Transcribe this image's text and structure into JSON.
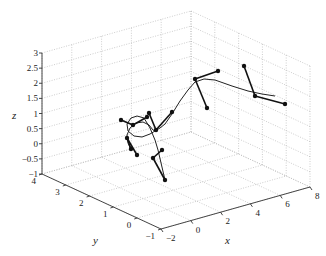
{
  "chart_data": {
    "type": "line3d",
    "title": "",
    "xlabel": "x",
    "ylabel": "y",
    "zlabel": "z",
    "xlim": [
      -2,
      8
    ],
    "ylim": [
      -1,
      4
    ],
    "zlim": [
      -1,
      3
    ],
    "xticks": [
      "-2",
      "0",
      "2",
      "4",
      "6",
      "8"
    ],
    "yticks": [
      "-1",
      "0",
      "1",
      "2",
      "3",
      "4"
    ],
    "zticks": [
      "-1",
      "-0.5",
      "0",
      "0.5",
      "1",
      "1.5",
      "2",
      "2.5",
      "3"
    ],
    "grid": true,
    "legend": null,
    "curve_pixels": [
      [
        131,
        150
      ],
      [
        128,
        143
      ],
      [
        127,
        135
      ],
      [
        130,
        128
      ],
      [
        136,
        123
      ],
      [
        143,
        122
      ],
      [
        149,
        125
      ],
      [
        153,
        130
      ],
      [
        155,
        131
      ],
      [
        160,
        128
      ],
      [
        165,
        124
      ],
      [
        172,
        114
      ],
      [
        180,
        101
      ],
      [
        188,
        90
      ],
      [
        195,
        82
      ],
      [
        204,
        79
      ],
      [
        215,
        80
      ],
      [
        232,
        86
      ],
      [
        248,
        91
      ],
      [
        262,
        94
      ],
      [
        275,
        96
      ]
    ],
    "loop_pixels": [
      [
        155,
        131
      ],
      [
        150,
        134
      ],
      [
        142,
        137
      ],
      [
        134,
        136
      ],
      [
        128,
        131
      ],
      [
        127,
        124
      ],
      [
        131,
        118
      ],
      [
        137,
        116
      ],
      [
        144,
        118
      ]
    ],
    "tail_pixels": [
      [
        144,
        118
      ],
      [
        150,
        128
      ],
      [
        155,
        140
      ],
      [
        158,
        150
      ],
      [
        165,
        180
      ]
    ],
    "frames": [
      {
        "origin": [
          195,
          79
        ],
        "ends": [
          [
            218,
            71
          ],
          [
            207,
            108
          ]
        ]
      },
      {
        "origin": [
          255,
          96
        ],
        "ends": [
          [
            244,
            66
          ],
          [
            285,
            104
          ]
        ]
      },
      {
        "origin": [
          156,
          130
        ],
        "ends": [
          [
            149,
            113
          ],
          [
            172,
            112
          ]
        ]
      },
      {
        "origin": [
          133,
          125
        ],
        "ends": [
          [
            121,
            120
          ],
          [
            147,
            117
          ]
        ]
      },
      {
        "origin": [
          127,
          138
        ],
        "ends": [
          [
            131,
            149
          ],
          [
            137,
            155
          ]
        ]
      },
      {
        "origin": [
          153,
          158
        ],
        "ends": [
          [
            165,
            180
          ],
          [
            162,
            150
          ]
        ]
      }
    ]
  },
  "axes": {
    "x_label": "x",
    "y_label": "y",
    "z_label": "z"
  }
}
